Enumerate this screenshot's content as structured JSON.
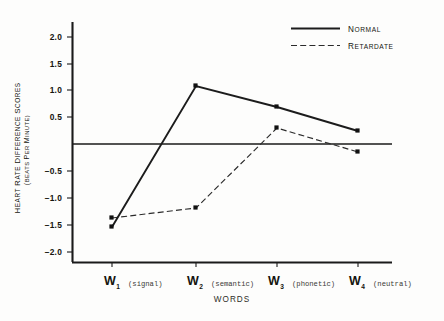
{
  "chart_data": {
    "type": "line",
    "title": "",
    "xlabel": "WORDS",
    "ylabel": "HEART RATE DIFFERENCE SCORES",
    "ylabel_sub": "(BEATS PER MINUTE)",
    "categories": [
      "W1",
      "W2",
      "W3",
      "W4"
    ],
    "category_labels": [
      {
        "symbol": "W",
        "subscript": "1",
        "descriptor": "(signal)"
      },
      {
        "symbol": "W",
        "subscript": "2",
        "descriptor": "(semantic)"
      },
      {
        "symbol": "W",
        "subscript": "3",
        "descriptor": "(phonetic)"
      },
      {
        "symbol": "W",
        "subscript": "4",
        "descriptor": "(neutral)"
      }
    ],
    "ylim": [
      -2.3,
      2.35
    ],
    "yticks": [
      2.0,
      1.5,
      1.0,
      0.5,
      -0.5,
      -1.0,
      -1.5,
      -2.0
    ],
    "ytick_labels": [
      "2.0",
      "1.5",
      "1.0",
      "0.5",
      "−0.5",
      "−1.0",
      "−1.5",
      "−2.0"
    ],
    "zero_reference_line": 0,
    "grid": false,
    "legend_position": "top-right",
    "series": [
      {
        "name": "Normal",
        "style": "solid",
        "color": "#1c1c1c",
        "values": [
          -1.54,
          1.08,
          0.69,
          0.24
        ]
      },
      {
        "name": "Retardate",
        "style": "dashed",
        "color": "#2b2b2b",
        "values": [
          -1.37,
          -1.18,
          0.3,
          -0.15
        ]
      }
    ]
  },
  "legend": {
    "items": [
      {
        "label": "Normal",
        "style": "solid"
      },
      {
        "label": "Retardate",
        "style": "dashed"
      }
    ]
  },
  "axis": {
    "x_title": "WORDS",
    "y_title_line1": "HEART RATE DIFFERENCE SCORES",
    "y_title_line2": "(BEATS PER MINUTE)"
  }
}
